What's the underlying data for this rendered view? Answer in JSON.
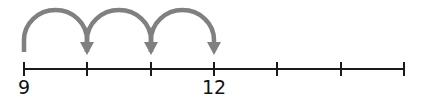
{
  "diagram": {
    "type": "number-line-jumps",
    "line": {
      "x_start": 24,
      "x_end": 404,
      "y": 69,
      "color": "#1a1a1a"
    },
    "ticks": [
      {
        "x": 24,
        "label": "9"
      },
      {
        "x": 87,
        "label": ""
      },
      {
        "x": 151,
        "label": ""
      },
      {
        "x": 214,
        "label": "12"
      },
      {
        "x": 277,
        "label": ""
      },
      {
        "x": 341,
        "label": ""
      },
      {
        "x": 404,
        "label": ""
      }
    ],
    "jumps": [
      {
        "from_tick": 0,
        "to_tick": 1
      },
      {
        "from_tick": 1,
        "to_tick": 2
      },
      {
        "from_tick": 2,
        "to_tick": 3
      }
    ],
    "jump_color": "#808080",
    "labels": {
      "start": "9",
      "end": "12"
    }
  }
}
